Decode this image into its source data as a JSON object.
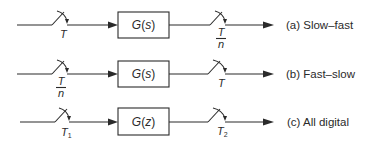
{
  "diagram": {
    "rows": [
      {
        "id": "a",
        "caption": "(a) Slow–fast",
        "block": {
          "func": "G",
          "arg": "s"
        },
        "input_sampler": {
          "label": "T"
        },
        "output_sampler": {
          "label_num": "T",
          "label_den": "n"
        }
      },
      {
        "id": "b",
        "caption": "(b) Fast–slow",
        "block": {
          "func": "G",
          "arg": "s"
        },
        "input_sampler": {
          "label_num": "T",
          "label_den": "n"
        },
        "output_sampler": {
          "label": "T"
        }
      },
      {
        "id": "c",
        "caption": "(c) All digital",
        "block": {
          "func": "G",
          "arg": "z"
        },
        "input_sampler": {
          "label": "T",
          "label_sub": "1"
        },
        "output_sampler": {
          "label": "T",
          "label_sub": "2"
        }
      }
    ],
    "colors": {
      "stroke": "#2a2a2a",
      "background": "#ffffff"
    }
  }
}
